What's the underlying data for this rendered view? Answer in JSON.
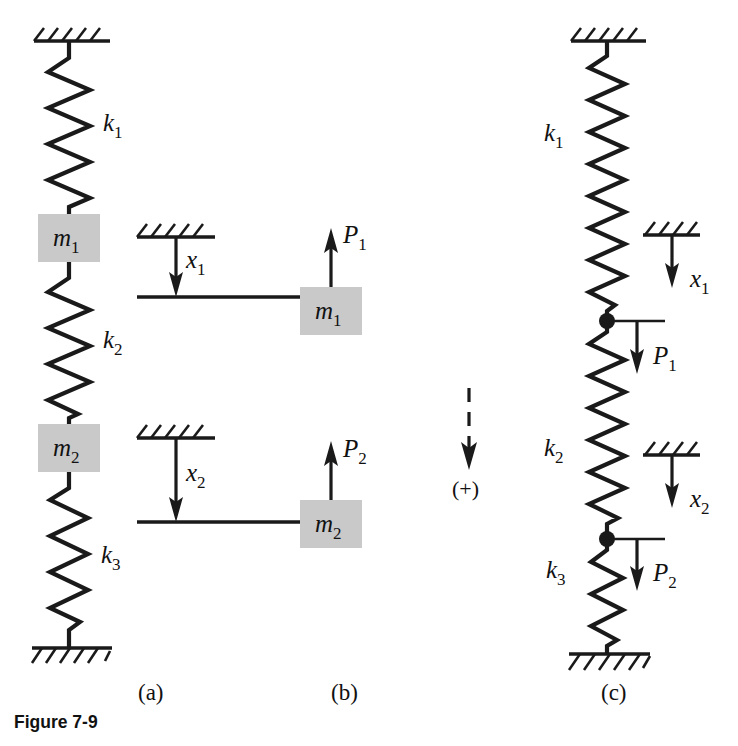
{
  "figure": {
    "caption": "Figure 7-9",
    "panels": [
      {
        "id": "a",
        "label": "(a)",
        "description": "physical spring-mass system"
      },
      {
        "id": "b",
        "label": "(b)",
        "description": "free-body diagrams with displacements"
      },
      {
        "id": "c",
        "label": "(c)",
        "description": "equivalent spring network"
      }
    ],
    "sign_convention": {
      "label": "(+)",
      "direction": "down",
      "style": "dashed-arrow"
    }
  },
  "labels": {
    "k1": {
      "base": "k",
      "sub": "1"
    },
    "k2": {
      "base": "k",
      "sub": "2"
    },
    "k3": {
      "base": "k",
      "sub": "3"
    },
    "m1": {
      "base": "m",
      "sub": "1"
    },
    "m2": {
      "base": "m",
      "sub": "2"
    },
    "x1": {
      "base": "x",
      "sub": "1"
    },
    "x2": {
      "base": "x",
      "sub": "2"
    },
    "P1": {
      "base": "P",
      "sub": "1"
    },
    "P2": {
      "base": "P",
      "sub": "2"
    }
  },
  "panel_a": {
    "springs": [
      {
        "name": "k1",
        "label_base": "k",
        "label_sub": "1",
        "from": "ceiling",
        "to": "m1"
      },
      {
        "name": "k2",
        "label_base": "k",
        "label_sub": "2",
        "from": "m1",
        "to": "m2"
      },
      {
        "name": "k3",
        "label_base": "k",
        "label_sub": "3",
        "from": "m2",
        "to": "ground"
      }
    ],
    "masses": [
      {
        "name": "m1",
        "label_base": "m",
        "label_sub": "1"
      },
      {
        "name": "m2",
        "label_base": "m",
        "label_sub": "2"
      }
    ],
    "supports": [
      "ceiling-hatch-top",
      "ground-hatch-bottom"
    ]
  },
  "panel_b": {
    "displacements": [
      {
        "name": "x1",
        "label_base": "x",
        "label_sub": "1",
        "direction": "down"
      },
      {
        "name": "x2",
        "label_base": "x",
        "label_sub": "2",
        "direction": "down"
      }
    ],
    "bodies": [
      {
        "mass_base": "m",
        "mass_sub": "1",
        "force_base": "P",
        "force_sub": "1",
        "force_direction": "up"
      },
      {
        "mass_base": "m",
        "mass_sub": "2",
        "force_base": "P",
        "force_sub": "2",
        "force_direction": "up"
      }
    ]
  },
  "panel_c": {
    "springs": [
      {
        "name": "k1",
        "label_base": "k",
        "label_sub": "1",
        "label_side": "left"
      },
      {
        "name": "k2",
        "label_base": "k",
        "label_sub": "2",
        "label_side": "left"
      },
      {
        "name": "k3",
        "label_base": "k",
        "label_sub": "3",
        "label_side": "left"
      }
    ],
    "nodes": [
      {
        "displacement_base": "x",
        "displacement_sub": "1",
        "force_base": "P",
        "force_sub": "1",
        "force_direction": "down"
      },
      {
        "displacement_base": "x",
        "displacement_sub": "2",
        "force_base": "P",
        "force_sub": "2",
        "force_direction": "down"
      }
    ],
    "supports": [
      "ceiling-hatch-top",
      "ground-hatch-bottom"
    ]
  },
  "colors": {
    "ink": "#1a1a1a",
    "mass_fill": "#c9c9c9",
    "background": "#ffffff"
  }
}
